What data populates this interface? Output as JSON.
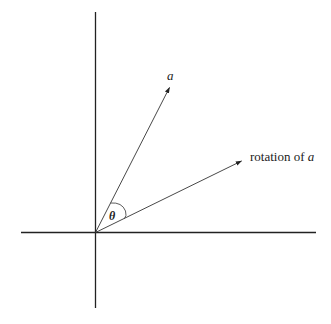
{
  "diagram": {
    "origin": [
      95.5,
      232.5
    ],
    "axes": {
      "horizontal": {
        "x1": 21,
        "x2": 316,
        "y": 232.5
      },
      "vertical": {
        "x": 95.5,
        "y1": 12,
        "y2": 308
      }
    },
    "vectors": [
      {
        "name": "a",
        "tip": [
          169.5,
          87.5
        ]
      },
      {
        "name": "rotation of a",
        "tip": [
          241.5,
          161
        ]
      }
    ],
    "labels": {
      "vector_a": "a",
      "rotation_prefix": "rotation of ",
      "rotation_var": "a",
      "angle": "θ"
    },
    "colors": {
      "line": "#222222",
      "background": "#ffffff"
    }
  }
}
